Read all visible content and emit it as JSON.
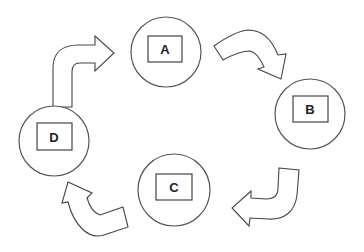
{
  "diagram": {
    "type": "cycle",
    "colors": {
      "stroke": "#444444",
      "fill": "#ffffff",
      "text": "#222222"
    },
    "nodes": [
      {
        "id": "A",
        "label": "A"
      },
      {
        "id": "B",
        "label": "B"
      },
      {
        "id": "C",
        "label": "C"
      },
      {
        "id": "D",
        "label": "D"
      }
    ],
    "edges": [
      {
        "from": "A",
        "to": "B",
        "icon": "curved-arrow-icon"
      },
      {
        "from": "B",
        "to": "C",
        "icon": "curved-arrow-icon"
      },
      {
        "from": "C",
        "to": "D",
        "icon": "curved-arrow-icon"
      },
      {
        "from": "D",
        "to": "A",
        "icon": "curved-arrow-icon"
      }
    ]
  }
}
